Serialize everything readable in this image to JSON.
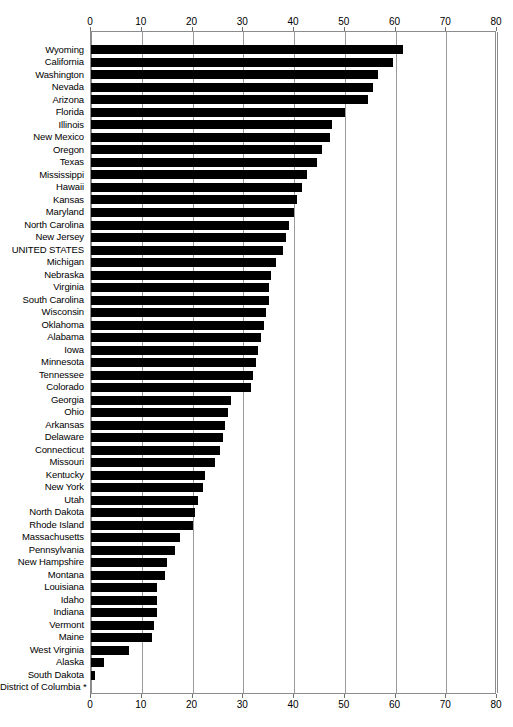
{
  "chart_data": {
    "type": "bar",
    "orientation": "horizontal",
    "title": "",
    "xlabel": "",
    "ylabel": "",
    "xlim": [
      0,
      80
    ],
    "xticks": [
      0,
      10,
      20,
      30,
      40,
      50,
      60,
      70,
      80
    ],
    "grid": true,
    "legend": false,
    "bar_color": "#000000",
    "axis_color": "#8c8c8c",
    "axis_position": "both",
    "footnote_marker": "*",
    "categories": [
      "Wyoming",
      "California",
      "Washington",
      "Nevada",
      "Arizona",
      "Florida",
      "Illinois",
      "New Mexico",
      "Oregon",
      "Texas",
      "Mississippi",
      "Hawaii",
      "Kansas",
      "Maryland",
      "North Carolina",
      "New Jersey",
      "UNITED STATES",
      "Michigan",
      "Nebraska",
      "Virginia",
      "South Carolina",
      "Wisconsin",
      "Oklahoma",
      "Alabama",
      "Iowa",
      "Minnesota",
      "Tennessee",
      "Colorado",
      "Georgia",
      "Ohio",
      "Arkansas",
      "Delaware",
      "Connecticut",
      "Missouri",
      "Kentucky",
      "New York",
      "Utah",
      "North Dakota",
      "Rhode Island",
      "Massachusetts",
      "Pennsylvania",
      "New Hampshire",
      "Montana",
      "Louisiana",
      "Idaho",
      "Indiana",
      "Vermont",
      "Maine",
      "West Virginia",
      "Alaska",
      "South Dakota",
      "District of Columbia"
    ],
    "values": [
      61.5,
      59.5,
      56.5,
      55.5,
      54.5,
      50.0,
      47.5,
      47.0,
      45.5,
      44.5,
      42.5,
      41.5,
      40.5,
      40.0,
      39.0,
      38.5,
      37.8,
      36.5,
      35.5,
      35.0,
      35.0,
      34.5,
      34.0,
      33.5,
      33.0,
      32.5,
      32.0,
      31.5,
      27.5,
      27.0,
      26.5,
      26.0,
      25.5,
      24.5,
      22.5,
      22.0,
      21.0,
      20.5,
      20.0,
      17.5,
      16.5,
      15.0,
      14.5,
      13.0,
      13.0,
      13.0,
      12.5,
      12.0,
      7.5,
      2.5,
      0.8,
      0.0
    ],
    "value_suffix": "",
    "notes": [
      "District of Columbia has no bar and is marked with an asterisk."
    ]
  }
}
